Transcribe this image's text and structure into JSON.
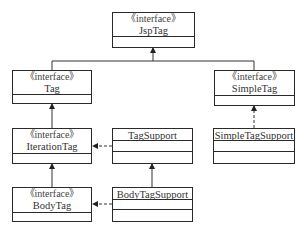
{
  "diagram": {
    "type": "uml-class-hierarchy",
    "nodes": [
      {
        "id": "jsptag",
        "stereotype": "《interface》",
        "name": "JspTag",
        "kind": "interface"
      },
      {
        "id": "tag",
        "stereotype": "《interface》",
        "name": "Tag",
        "kind": "interface"
      },
      {
        "id": "simpletag",
        "stereotype": "《interface》",
        "name": "SimpleTag",
        "kind": "interface"
      },
      {
        "id": "iterationtag",
        "stereotype": "《interface》",
        "name": "IterationTag",
        "kind": "interface"
      },
      {
        "id": "tagsupport",
        "stereotype": "",
        "name": "TagSupport",
        "kind": "class"
      },
      {
        "id": "simpletagsupport",
        "stereotype": "",
        "name": "SimpleTagSupport",
        "kind": "class"
      },
      {
        "id": "bodytag",
        "stereotype": "《interface》",
        "name": "BodyTag",
        "kind": "interface"
      },
      {
        "id": "bodytagsupport",
        "stereotype": "",
        "name": "BodyTagSupport",
        "kind": "class"
      }
    ],
    "edges": [
      {
        "from": "tag",
        "to": "jsptag",
        "type": "generalization",
        "style": "solid"
      },
      {
        "from": "simpletag",
        "to": "jsptag",
        "type": "generalization",
        "style": "solid"
      },
      {
        "from": "iterationtag",
        "to": "tag",
        "type": "generalization",
        "style": "solid"
      },
      {
        "from": "bodytag",
        "to": "iterationtag",
        "type": "generalization",
        "style": "solid"
      },
      {
        "from": "simpletagsupport",
        "to": "simpletag",
        "type": "realization",
        "style": "dashed"
      },
      {
        "from": "tagsupport",
        "to": "iterationtag",
        "type": "realization",
        "style": "dashed"
      },
      {
        "from": "bodytagsupport",
        "to": "tagsupport",
        "type": "generalization",
        "style": "solid"
      },
      {
        "from": "bodytagsupport",
        "to": "bodytag",
        "type": "realization",
        "style": "dashed"
      }
    ]
  }
}
